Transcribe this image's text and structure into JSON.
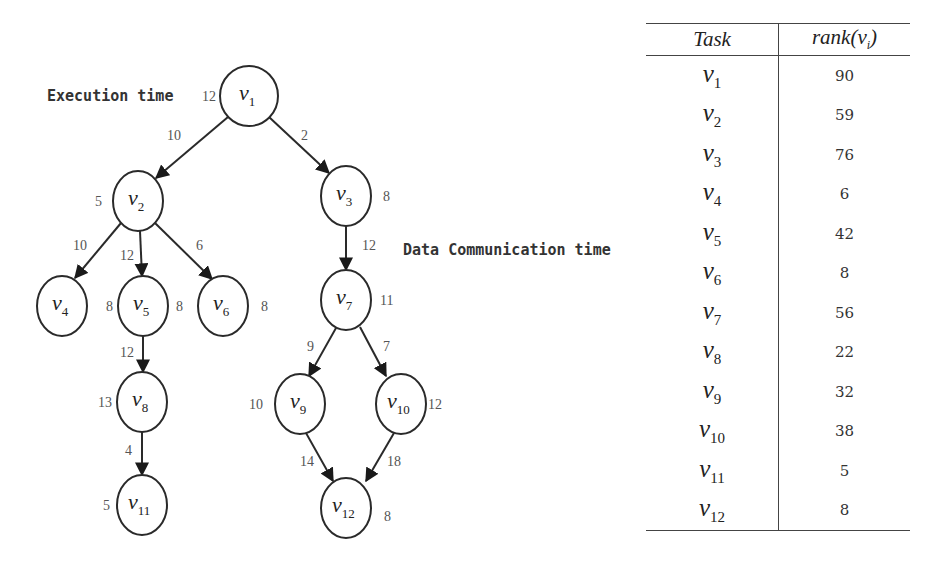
{
  "diagram": {
    "legend": {
      "execution_time": "Execution time",
      "data_communication_time": "Data Communication time"
    },
    "nodes": [
      {
        "id": "v1",
        "label": "v",
        "sub": "1",
        "exec_time": "12",
        "cx": 249,
        "cy": 96,
        "rx": 29,
        "ry": 30,
        "wx": 202,
        "wy": 101
      },
      {
        "id": "v2",
        "label": "v",
        "sub": "2",
        "exec_time": "5",
        "cx": 138,
        "cy": 201,
        "rx": 25,
        "ry": 30,
        "wx": 95,
        "wy": 206
      },
      {
        "id": "v3",
        "label": "v",
        "sub": "3",
        "exec_time": "8",
        "cx": 346,
        "cy": 196,
        "rx": 25,
        "ry": 30,
        "wx": 383,
        "wy": 201
      },
      {
        "id": "v4",
        "label": "v",
        "sub": "4",
        "exec_time": "8",
        "cx": 62,
        "cy": 306,
        "rx": 25,
        "ry": 30,
        "wx": 106,
        "wy": 311
      },
      {
        "id": "v5",
        "label": "v",
        "sub": "5",
        "exec_time": "",
        "cx": 143,
        "cy": 306,
        "rx": 25,
        "ry": 30,
        "wx": 0,
        "wy": 0
      },
      {
        "id": "v6",
        "label": "v",
        "sub": "6",
        "exec_time": "8",
        "cx": 223,
        "cy": 306,
        "rx": 25,
        "ry": 30,
        "wx": 261,
        "wy": 311
      },
      {
        "id": "v7",
        "label": "v",
        "sub": "7",
        "exec_time": "11",
        "cx": 346,
        "cy": 300,
        "rx": 25,
        "ry": 30,
        "wx": 380,
        "wy": 305
      },
      {
        "id": "v8",
        "label": "v",
        "sub": "8",
        "exec_time": "13",
        "cx": 142,
        "cy": 402,
        "rx": 25,
        "ry": 30,
        "wx": 98,
        "wy": 407
      },
      {
        "id": "v9",
        "label": "v",
        "sub": "9",
        "exec_time": "10",
        "cx": 300,
        "cy": 404,
        "rx": 25,
        "ry": 30,
        "wx": 249,
        "wy": 409
      },
      {
        "id": "v10",
        "label": "v",
        "sub": "10",
        "exec_time": "12",
        "cx": 401,
        "cy": 404,
        "rx": 25,
        "ry": 30,
        "wx": 428,
        "wy": 409
      },
      {
        "id": "v11",
        "label": "v",
        "sub": "11",
        "exec_time": "5",
        "cx": 142,
        "cy": 505,
        "rx": 25,
        "ry": 30,
        "wx": 103,
        "wy": 510
      },
      {
        "id": "v12",
        "label": "v",
        "sub": "12",
        "exec_time": "8",
        "cx": 346,
        "cy": 508,
        "rx": 25,
        "ry": 30,
        "wx": 384,
        "wy": 521
      }
    ],
    "v5_exec_time": "8",
    "edges": [
      {
        "from": "v1",
        "to": "v2",
        "comm_time": "10",
        "x1": 228,
        "y1": 117,
        "x2": 156,
        "y2": 178,
        "lx": 167,
        "ly": 140
      },
      {
        "from": "v1",
        "to": "v3",
        "comm_time": "2",
        "x1": 269,
        "y1": 117,
        "x2": 329,
        "y2": 173,
        "lx": 301,
        "ly": 140
      },
      {
        "from": "v2",
        "to": "v4",
        "comm_time": "10",
        "x1": 121,
        "y1": 223,
        "x2": 75,
        "y2": 278,
        "lx": 73,
        "ly": 250
      },
      {
        "from": "v2",
        "to": "v5",
        "comm_time": "12",
        "x1": 140,
        "y1": 231,
        "x2": 142,
        "y2": 276,
        "lx": 120,
        "ly": 260
      },
      {
        "from": "v2",
        "to": "v6",
        "comm_time": "6",
        "x1": 155,
        "y1": 223,
        "x2": 212,
        "y2": 279,
        "lx": 196,
        "ly": 250
      },
      {
        "from": "v3",
        "to": "v7",
        "comm_time": "12",
        "x1": 346,
        "y1": 226,
        "x2": 346,
        "y2": 270,
        "lx": 362,
        "ly": 250
      },
      {
        "from": "v5",
        "to": "v8",
        "comm_time": "12",
        "x1": 143,
        "y1": 336,
        "x2": 143,
        "y2": 372,
        "lx": 120,
        "ly": 357
      },
      {
        "from": "v7",
        "to": "v9",
        "comm_time": "9",
        "x1": 336,
        "y1": 328,
        "x2": 309,
        "y2": 376,
        "lx": 307,
        "ly": 351
      },
      {
        "from": "v7",
        "to": "v10",
        "comm_time": "7",
        "x1": 360,
        "y1": 327,
        "x2": 386,
        "y2": 376,
        "lx": 383,
        "ly": 351
      },
      {
        "from": "v8",
        "to": "v11",
        "comm_time": "4",
        "x1": 142,
        "y1": 432,
        "x2": 142,
        "y2": 475,
        "lx": 125,
        "ly": 455
      },
      {
        "from": "v9",
        "to": "v12",
        "comm_time": "14",
        "x1": 306,
        "y1": 433,
        "x2": 333,
        "y2": 481,
        "lx": 300,
        "ly": 466
      },
      {
        "from": "v10",
        "to": "v12",
        "comm_time": "18",
        "x1": 394,
        "y1": 433,
        "x2": 366,
        "y2": 481,
        "lx": 387,
        "ly": 466
      }
    ]
  },
  "table": {
    "headers": {
      "task": "Task",
      "rank_prefix": "rank(v",
      "rank_sub": "i",
      "rank_suffix": ")"
    },
    "rows": [
      {
        "task": "v",
        "sub": "1",
        "rank": "90"
      },
      {
        "task": "v",
        "sub": "2",
        "rank": "59"
      },
      {
        "task": "v",
        "sub": "3",
        "rank": "76"
      },
      {
        "task": "v",
        "sub": "4",
        "rank": "6"
      },
      {
        "task": "v",
        "sub": "5",
        "rank": "42"
      },
      {
        "task": "v",
        "sub": "6",
        "rank": "8"
      },
      {
        "task": "v",
        "sub": "7",
        "rank": "56"
      },
      {
        "task": "v",
        "sub": "8",
        "rank": "22"
      },
      {
        "task": "v",
        "sub": "9",
        "rank": "32"
      },
      {
        "task": "v",
        "sub": "10",
        "rank": "38"
      },
      {
        "task": "v",
        "sub": "11",
        "rank": "5"
      },
      {
        "task": "v",
        "sub": "12",
        "rank": "8"
      }
    ]
  }
}
